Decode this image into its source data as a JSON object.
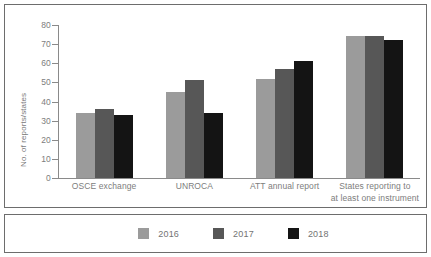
{
  "chart_data": {
    "type": "bar",
    "title": "",
    "subtitle": "",
    "xlabel": "",
    "ylabel": "No. of reports/states",
    "ylim": [
      0,
      80
    ],
    "ytick_step": 10,
    "yticks": [
      0,
      10,
      20,
      30,
      40,
      50,
      60,
      70,
      80
    ],
    "ytick_labels": [
      "0",
      "10",
      "20",
      "30",
      "40",
      "50",
      "60",
      "70",
      "80"
    ],
    "grid": false,
    "legend_position": "bottom",
    "categories": [
      "OSCE exchange",
      "UNROCA",
      "ATT annual report",
      "States reporting to at least one instrument"
    ],
    "category_label_lines": [
      [
        "OSCE exchange"
      ],
      [
        "UNROCA"
      ],
      [
        "ATT annual report"
      ],
      [
        "States reporting to",
        "at least one instrument"
      ]
    ],
    "series": [
      {
        "name": "2016",
        "color": "#9b9b9b",
        "values": [
          34,
          45,
          52,
          74
        ]
      },
      {
        "name": "2017",
        "color": "#575757",
        "values": [
          36,
          51,
          57,
          74
        ]
      },
      {
        "name": "2018",
        "color": "#141414",
        "values": [
          33,
          34,
          61,
          72
        ]
      }
    ],
    "annotations": []
  },
  "legend": {
    "items": [
      {
        "label": "2016",
        "color": "#9b9b9b"
      },
      {
        "label": "2017",
        "color": "#575757"
      },
      {
        "label": "2018",
        "color": "#141414"
      }
    ]
  },
  "colors": {
    "border": "#6d6d6d",
    "axis": "#8a8a8a",
    "text": "#7d7d7d",
    "background": "#ffffff"
  }
}
